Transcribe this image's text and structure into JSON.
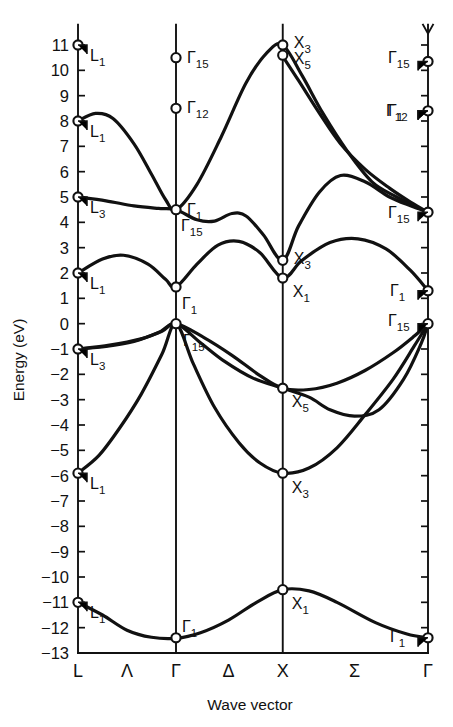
{
  "figure": {
    "axis_title_y": "Energy (eV)",
    "axis_title_x": "Wave vector"
  },
  "chart_data": {
    "type": "line",
    "title": "",
    "xlabel": "Wave vector",
    "ylabel": "Energy (eV)",
    "ylim": [
      -13,
      11
    ],
    "grid": false,
    "legend": false,
    "ytick_labels": [
      "11",
      "10",
      "9",
      "8",
      "7",
      "6",
      "5",
      "4",
      "3",
      "2",
      "1",
      "0",
      "-1",
      "-2",
      "-3",
      "-4",
      "-5",
      "-6",
      "-7",
      "-8",
      "-9",
      "-10",
      "-11",
      "-12",
      "-13"
    ],
    "ytick_values": [
      11,
      10,
      9,
      8,
      7,
      6,
      5,
      4,
      3,
      2,
      1,
      0,
      -1,
      -2,
      -3,
      -4,
      -5,
      -6,
      -7,
      -8,
      -9,
      -10,
      -11,
      -12,
      -13
    ],
    "xtick_labels": [
      "L",
      "Λ",
      "Γ",
      "Δ",
      "X",
      "Σ",
      "Γ"
    ],
    "symmetry_points": [
      {
        "label": "L",
        "x_frac": 0.0
      },
      {
        "label": "Γ",
        "x_frac": 0.28
      },
      {
        "label": "X",
        "x_frac": 0.585
      },
      {
        "label": "Γ",
        "x_frac": 1.0
      }
    ],
    "symmetry_lines": [
      {
        "label": "Λ",
        "between": [
          "L",
          "Γ"
        ]
      },
      {
        "label": "Δ",
        "between": [
          "Γ",
          "X"
        ]
      },
      {
        "label": "Σ",
        "between": [
          "X",
          "Γ"
        ]
      }
    ],
    "state_labels": [
      {
        "text": "L",
        "sub": "1",
        "energy": 11.0,
        "at": "L"
      },
      {
        "text": "L",
        "sub": "1",
        "energy": 8.0,
        "at": "L"
      },
      {
        "text": "L",
        "sub": "3",
        "energy": 5.0,
        "at": "L"
      },
      {
        "text": "L",
        "sub": "1",
        "energy": 2.0,
        "at": "L"
      },
      {
        "text": "L",
        "sub": "3",
        "energy": -1.0,
        "at": "L"
      },
      {
        "text": "L",
        "sub": "1",
        "energy": -5.9,
        "at": "L"
      },
      {
        "text": "L",
        "sub": "1",
        "energy": -11.0,
        "at": "L"
      },
      {
        "text": "Γ",
        "sub": "15",
        "energy": 10.5,
        "at": "Γ"
      },
      {
        "text": "Γ",
        "sub": "12",
        "energy": 8.5,
        "at": "Γ"
      },
      {
        "text": "Γ",
        "sub": "1",
        "energy": 4.5,
        "at": "Γ"
      },
      {
        "text": "Γ",
        "sub": "15",
        "energy": 4.45,
        "at": "Γ"
      },
      {
        "text": "Γ",
        "sub": "1",
        "energy": 1.45,
        "at": "Γ"
      },
      {
        "text": "Γ",
        "sub": "15",
        "energy": 0.0,
        "at": "Γ"
      },
      {
        "text": "Γ",
        "sub": "1",
        "energy": -12.4,
        "at": "Γ"
      },
      {
        "text": "X",
        "sub": "3",
        "energy": 11.0,
        "at": "X"
      },
      {
        "text": "X",
        "sub": "5",
        "energy": 10.6,
        "at": "X"
      },
      {
        "text": "X",
        "sub": "3",
        "energy": 2.5,
        "at": "X"
      },
      {
        "text": "X",
        "sub": "1",
        "energy": 1.8,
        "at": "X"
      },
      {
        "text": "X",
        "sub": "5",
        "energy": -2.55,
        "at": "X"
      },
      {
        "text": "X",
        "sub": "3",
        "energy": -5.9,
        "at": "X"
      },
      {
        "text": "X",
        "sub": "1",
        "energy": -10.5,
        "at": "X"
      },
      {
        "text": "Γ",
        "sub": "15",
        "energy": 10.35,
        "at": "Γr"
      },
      {
        "text": "Γ",
        "sub": "12",
        "energy": 8.4,
        "at": "Γr"
      },
      {
        "text": "Γ",
        "sub": "1",
        "energy": 8.4,
        "at": "Γr"
      },
      {
        "text": "Γ",
        "sub": "15",
        "energy": 4.4,
        "at": "Γr"
      },
      {
        "text": "Γ",
        "sub": "1",
        "energy": 1.3,
        "at": "Γr"
      },
      {
        "text": "Γ",
        "sub": "15",
        "energy": 0.0,
        "at": "Γr"
      },
      {
        "text": "Γ",
        "sub": "1",
        "energy": -12.4,
        "at": "Γr"
      }
    ],
    "marker_points": [
      {
        "label": "L1-top",
        "x_frac": 0.0,
        "energy": 11.0
      },
      {
        "label": "L1",
        "x_frac": 0.0,
        "energy": 8.0
      },
      {
        "label": "L3",
        "x_frac": 0.0,
        "energy": 5.0
      },
      {
        "label": "L1-cond",
        "x_frac": 0.0,
        "energy": 2.0
      },
      {
        "label": "L3-val",
        "x_frac": 0.0,
        "energy": -1.0
      },
      {
        "label": "L1-val",
        "x_frac": 0.0,
        "energy": -5.9
      },
      {
        "label": "L1-bottom",
        "x_frac": 0.0,
        "energy": -11.0
      },
      {
        "label": "G15",
        "x_frac": 0.28,
        "energy": 10.5
      },
      {
        "label": "G12",
        "x_frac": 0.28,
        "energy": 8.5
      },
      {
        "label": "G15-cond",
        "x_frac": 0.28,
        "energy": 4.5
      },
      {
        "label": "G1-cond",
        "x_frac": 0.28,
        "energy": 1.45
      },
      {
        "label": "G15-val",
        "x_frac": 0.28,
        "energy": 0.0
      },
      {
        "label": "G1-bottom",
        "x_frac": 0.28,
        "energy": -12.4
      },
      {
        "label": "X3-top",
        "x_frac": 0.585,
        "energy": 11.0
      },
      {
        "label": "X5-top",
        "x_frac": 0.585,
        "energy": 10.6
      },
      {
        "label": "X3-cond",
        "x_frac": 0.585,
        "energy": 2.5
      },
      {
        "label": "X1-cond",
        "x_frac": 0.585,
        "energy": 1.8
      },
      {
        "label": "X5-val",
        "x_frac": 0.585,
        "energy": -2.55
      },
      {
        "label": "X3-val",
        "x_frac": 0.585,
        "energy": -5.9
      },
      {
        "label": "X1-bottom",
        "x_frac": 0.585,
        "energy": -10.5
      },
      {
        "label": "G15-r",
        "x_frac": 1.0,
        "energy": 10.35
      },
      {
        "label": "G1-r",
        "x_frac": 1.0,
        "energy": 8.4
      },
      {
        "label": "G15-cond-r",
        "x_frac": 1.0,
        "energy": 4.4
      },
      {
        "label": "G1-cond-r",
        "x_frac": 1.0,
        "energy": 1.3
      },
      {
        "label": "G15-val-r",
        "x_frac": 1.0,
        "energy": 0.0
      },
      {
        "label": "G1-bottom-r",
        "x_frac": 1.0,
        "energy": -12.4
      }
    ],
    "series": [
      {
        "name": "band-1-lowest-valence",
        "points": [
          [
            0.0,
            -11.0
          ],
          [
            0.07,
            -11.5
          ],
          [
            0.14,
            -12.1
          ],
          [
            0.21,
            -12.38
          ],
          [
            0.28,
            -12.42
          ],
          [
            0.35,
            -12.2
          ],
          [
            0.43,
            -11.7
          ],
          [
            0.51,
            -11.0
          ],
          [
            0.585,
            -10.5
          ],
          [
            0.66,
            -10.55
          ],
          [
            0.74,
            -11.0
          ],
          [
            0.85,
            -11.8
          ],
          [
            0.94,
            -12.25
          ],
          [
            1.0,
            -12.4
          ]
        ]
      },
      {
        "name": "band-2-valence",
        "points": [
          [
            0.0,
            -5.9
          ],
          [
            0.06,
            -5.2
          ],
          [
            0.12,
            -4.1
          ],
          [
            0.18,
            -2.8
          ],
          [
            0.24,
            -1.2
          ],
          [
            0.28,
            0.0
          ],
          [
            0.33,
            -1.6
          ],
          [
            0.39,
            -3.3
          ],
          [
            0.46,
            -4.7
          ],
          [
            0.52,
            -5.5
          ],
          [
            0.585,
            -5.9
          ],
          [
            0.66,
            -5.7
          ],
          [
            0.74,
            -4.9
          ],
          [
            0.82,
            -3.6
          ],
          [
            0.9,
            -2.2
          ],
          [
            0.96,
            -0.9
          ],
          [
            1.0,
            0.0
          ]
        ]
      },
      {
        "name": "band-3-valence",
        "points": [
          [
            0.0,
            -1.0
          ],
          [
            0.08,
            -0.9
          ],
          [
            0.16,
            -0.7
          ],
          [
            0.23,
            -0.35
          ],
          [
            0.28,
            0.0
          ],
          [
            0.35,
            -0.75
          ],
          [
            0.42,
            -1.5
          ],
          [
            0.5,
            -2.15
          ],
          [
            0.585,
            -2.55
          ],
          [
            0.66,
            -2.9
          ],
          [
            0.72,
            -3.4
          ],
          [
            0.79,
            -3.65
          ],
          [
            0.86,
            -3.4
          ],
          [
            0.93,
            -2.2
          ],
          [
            0.98,
            -0.8
          ],
          [
            1.0,
            0.0
          ]
        ]
      },
      {
        "name": "band-4-valence",
        "points": [
          [
            0.0,
            -1.0
          ],
          [
            0.09,
            -0.85
          ],
          [
            0.18,
            -0.6
          ],
          [
            0.24,
            -0.3
          ],
          [
            0.28,
            0.0
          ],
          [
            0.36,
            -0.55
          ],
          [
            0.44,
            -1.25
          ],
          [
            0.52,
            -2.05
          ],
          [
            0.585,
            -2.55
          ],
          [
            0.66,
            -2.6
          ],
          [
            0.74,
            -2.35
          ],
          [
            0.82,
            -1.85
          ],
          [
            0.9,
            -1.15
          ],
          [
            0.96,
            -0.5
          ],
          [
            1.0,
            0.0
          ]
        ]
      },
      {
        "name": "band-5-conduction-lower",
        "points": [
          [
            0.0,
            2.0
          ],
          [
            0.07,
            2.55
          ],
          [
            0.13,
            2.7
          ],
          [
            0.2,
            2.35
          ],
          [
            0.25,
            1.75
          ],
          [
            0.28,
            1.45
          ],
          [
            0.34,
            2.35
          ],
          [
            0.4,
            3.1
          ],
          [
            0.46,
            3.25
          ],
          [
            0.52,
            2.8
          ],
          [
            0.585,
            1.8
          ],
          [
            0.64,
            2.5
          ],
          [
            0.72,
            3.2
          ],
          [
            0.8,
            3.35
          ],
          [
            0.88,
            2.95
          ],
          [
            0.95,
            2.1
          ],
          [
            1.0,
            1.3
          ]
        ]
      },
      {
        "name": "band-6-conduction-mid",
        "points": [
          [
            0.0,
            5.0
          ],
          [
            0.08,
            4.85
          ],
          [
            0.16,
            4.65
          ],
          [
            0.23,
            4.55
          ],
          [
            0.28,
            4.5
          ],
          [
            0.34,
            4.1
          ],
          [
            0.39,
            4.05
          ],
          [
            0.44,
            4.35
          ],
          [
            0.48,
            4.25
          ],
          [
            0.53,
            3.5
          ],
          [
            0.585,
            2.5
          ],
          [
            0.63,
            3.85
          ],
          [
            0.69,
            5.2
          ],
          [
            0.75,
            5.85
          ],
          [
            0.82,
            5.6
          ],
          [
            0.89,
            5.0
          ],
          [
            0.95,
            4.65
          ],
          [
            1.0,
            4.4
          ]
        ]
      },
      {
        "name": "band-7-conduction-upper",
        "points": [
          [
            0.0,
            8.0
          ],
          [
            0.05,
            8.3
          ],
          [
            0.1,
            8.1
          ],
          [
            0.16,
            7.1
          ],
          [
            0.21,
            5.9
          ],
          [
            0.25,
            4.9
          ],
          [
            0.28,
            4.5
          ],
          [
            0.34,
            5.5
          ],
          [
            0.41,
            7.4
          ],
          [
            0.48,
            9.5
          ],
          [
            0.54,
            10.7
          ],
          [
            0.585,
            11.0
          ],
          [
            0.64,
            9.8
          ],
          [
            0.7,
            8.3
          ],
          [
            0.77,
            6.8
          ],
          [
            0.84,
            5.6
          ],
          [
            0.91,
            5.0
          ],
          [
            0.96,
            4.65
          ],
          [
            1.0,
            4.4
          ]
        ]
      },
      {
        "name": "band-8-conduction-x5",
        "points": [
          [
            0.585,
            10.55
          ],
          [
            0.63,
            9.6
          ],
          [
            0.69,
            8.3
          ],
          [
            0.75,
            7.1
          ],
          [
            0.82,
            6.1
          ],
          [
            0.89,
            5.35
          ],
          [
            0.95,
            4.8
          ],
          [
            1.0,
            4.4
          ]
        ]
      }
    ]
  }
}
